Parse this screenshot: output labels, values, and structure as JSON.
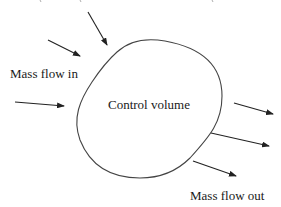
{
  "diagram": {
    "type": "control-volume-schematic",
    "labels": {
      "inflow": "Mass flow in",
      "volume": "Control volume",
      "outflow": "Mass flow out"
    },
    "colors": {
      "stroke": "#333333",
      "text": "#1a1a1a",
      "background": "#ffffff"
    },
    "inflow_arrows": [
      {
        "x1": 88,
        "y1": 12,
        "x2": 107,
        "y2": 45
      },
      {
        "x1": 48,
        "y1": 40,
        "x2": 80,
        "y2": 56
      },
      {
        "x1": 15,
        "y1": 102,
        "x2": 64,
        "y2": 106
      }
    ],
    "outflow_arrows": [
      {
        "x1": 234,
        "y1": 103,
        "x2": 273,
        "y2": 114
      },
      {
        "x1": 211,
        "y1": 133,
        "x2": 269,
        "y2": 146
      },
      {
        "x1": 193,
        "y1": 161,
        "x2": 236,
        "y2": 176
      }
    ]
  }
}
